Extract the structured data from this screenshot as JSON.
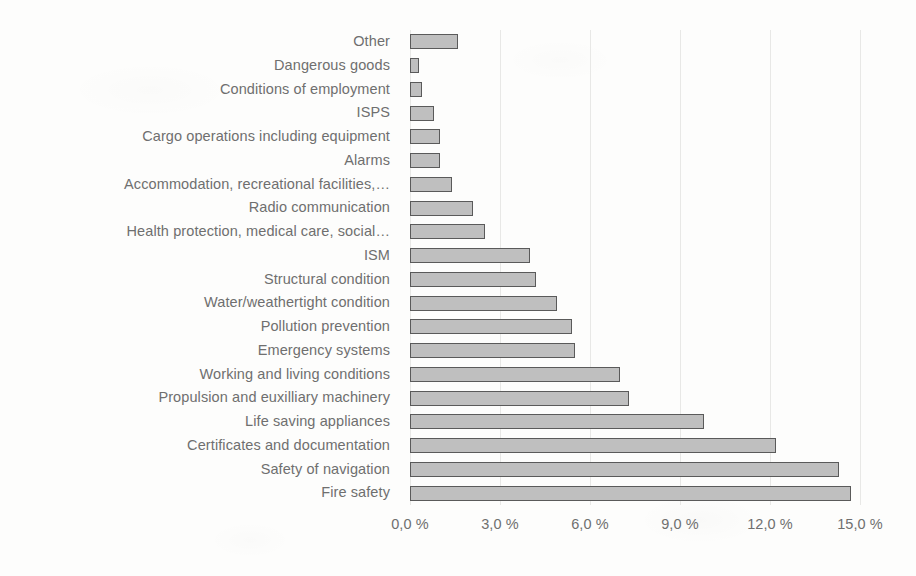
{
  "chart_data": {
    "type": "bar",
    "orientation": "horizontal",
    "title": "",
    "subtitle": "",
    "xlabel": "",
    "ylabel": "",
    "xlim": [
      0,
      15
    ],
    "ylim": null,
    "grid": true,
    "legend": false,
    "legend_position": "none",
    "value_unit": "%",
    "decimal_separator": ",",
    "axis_tick_labels": [
      "0,0 %",
      "3,0 %",
      "6,0 %",
      "9,0 %",
      "12,0 %",
      "15,0 %"
    ],
    "axis_tick_values": [
      0,
      3,
      6,
      9,
      12,
      15
    ],
    "categories": [
      "Other",
      "Dangerous goods",
      "Conditions of employment",
      "ISPS",
      "Cargo operations including equipment",
      "Alarms",
      "Accommodation, recreational facilities,…",
      "Radio communication",
      "Health protection, medical care, social…",
      "ISM",
      "Structural condition",
      "Water/weathertight condition",
      "Pollution prevention",
      "Emergency systems",
      "Working and living conditions",
      "Propulsion and euxilliary machinery",
      "Life saving appliances",
      "Certificates and documentation",
      "Safety of navigation",
      "Fire safety"
    ],
    "values": [
      1.6,
      0.3,
      0.4,
      0.8,
      1.0,
      1.0,
      1.4,
      2.1,
      2.5,
      4.0,
      4.2,
      4.9,
      5.4,
      5.5,
      7.0,
      7.3,
      9.8,
      12.2,
      14.3,
      14.7
    ],
    "colors": {
      "bar_fill": "#bfbfbf",
      "bar_border": "#5a5a5a",
      "gridline": "#e8e8e6",
      "text": "#6f6f6f",
      "background": "#fdfdfc"
    }
  }
}
